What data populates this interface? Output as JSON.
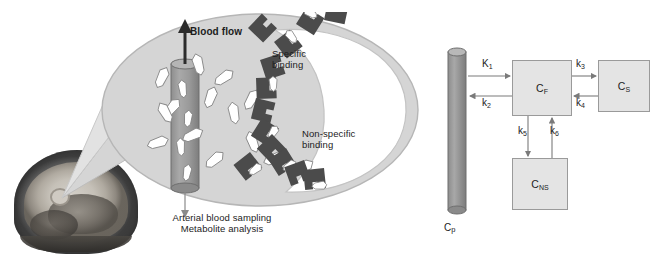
{
  "figure": {
    "panels": [
      "tissue-illustration",
      "compartment-model"
    ]
  },
  "left_panel": {
    "name": "tissue-illustration",
    "brain_image_label": "sagittal-brain-mri",
    "labels": {
      "blood_flow": "Blood flow",
      "specific_binding_line1": "Specific",
      "specific_binding_line2": "binding",
      "nonspecific_binding_line1": "Non-specific",
      "nonspecific_binding_line2": "binding",
      "sampling_line1": "Arterial blood sampling",
      "sampling_line2": "Metabolite analysis"
    },
    "icons": {
      "blood_flow_arrow": "up-arrow-icon",
      "sampling_arrow": "down-arrow-icon",
      "capillary": "capillary-cylinder-icon",
      "tracer": "tracer-molecule-icon",
      "receptor": "receptor-notch-icon",
      "callout": "callout-cone-icon"
    },
    "counts": {
      "free_tracers": 14,
      "receptors": 13,
      "bound_tracers": 7,
      "tracers_in_capillary": 4
    }
  },
  "right_panel": {
    "name": "compartment-model",
    "plasma": {
      "label": "C",
      "subscript": "p",
      "icon": "plasma-cylinder-icon"
    },
    "compartments": [
      {
        "id": "cf",
        "label": "C",
        "subscript": "F",
        "name": "free-compartment"
      },
      {
        "id": "cs",
        "label": "C",
        "subscript": "S",
        "name": "specific-binding-compartment"
      },
      {
        "id": "cns",
        "label": "C",
        "subscript": "NS",
        "name": "nonspecific-binding-compartment"
      }
    ],
    "rate_constants": [
      {
        "id": "k1",
        "label": "K",
        "subscript": "1",
        "from": "plasma",
        "to": "cf",
        "direction": "right"
      },
      {
        "id": "k2",
        "label": "k",
        "subscript": "2",
        "from": "cf",
        "to": "plasma",
        "direction": "left"
      },
      {
        "id": "k3",
        "label": "k",
        "subscript": "3",
        "from": "cf",
        "to": "cs",
        "direction": "right"
      },
      {
        "id": "k4",
        "label": "k",
        "subscript": "4",
        "from": "cs",
        "to": "cf",
        "direction": "left"
      },
      {
        "id": "k5",
        "label": "k",
        "subscript": "5",
        "from": "cf",
        "to": "cns",
        "direction": "down"
      },
      {
        "id": "k6",
        "label": "k",
        "subscript": "6",
        "from": "cns",
        "to": "cf",
        "direction": "up"
      }
    ]
  },
  "colors": {
    "background": "#ffffff",
    "cell_fill": "#d5d5d5",
    "cell_inner": "#ffffff",
    "cell_stroke": "#b4b4b4",
    "capillary_fill": "#9c9c9c",
    "capillary_stroke": "#6d6d6d",
    "tracer_fill": "#ffffff",
    "tracer_stroke": "#8a8a8a",
    "receptor_fill": "#4b4b4b",
    "box_fill": "#e4e4e4",
    "box_stroke": "#9a9a9a",
    "arrow": "#7a7a7a",
    "text": "#1c1c1c"
  }
}
